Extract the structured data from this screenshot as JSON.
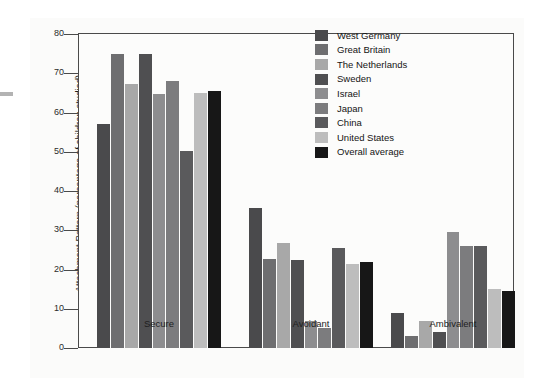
{
  "chart_data": {
    "type": "bar",
    "title": "",
    "xlabel": "",
    "ylabel": "Attachment Pattern (percentage of children studied)",
    "categories": [
      "Secure",
      "Avoidant",
      "Ambivalent"
    ],
    "ylim": [
      0,
      80
    ],
    "yticks": [
      0,
      10,
      20,
      30,
      40,
      50,
      60,
      70,
      80
    ],
    "grid": false,
    "legend_position": "top-right",
    "series": [
      {
        "name": "West Germany",
        "color": "#4a4a4c",
        "values": [
          57.0,
          35.8,
          8.8
        ]
      },
      {
        "name": "Great Britain",
        "color": "#6e6e70",
        "values": [
          75.0,
          22.8,
          3.0
        ]
      },
      {
        "name": "The Netherlands",
        "color": "#a8a8a8",
        "values": [
          67.3,
          26.8,
          7.0
        ]
      },
      {
        "name": "Sweden",
        "color": "#4f4f51",
        "values": [
          74.8,
          22.4,
          4.2
        ]
      },
      {
        "name": "Israel",
        "color": "#8d8d8f",
        "values": [
          64.8,
          6.8,
          29.5
        ]
      },
      {
        "name": "Japan",
        "color": "#7c7c7e",
        "values": [
          68.0,
          5.2,
          26.0
        ]
      },
      {
        "name": "China",
        "color": "#5a5a5c",
        "values": [
          50.2,
          25.4,
          26.0
        ]
      },
      {
        "name": "United States",
        "color": "#bdbdbd",
        "values": [
          65.0,
          21.4,
          15.0
        ]
      },
      {
        "name": "Overall average",
        "color": "#171717",
        "values": [
          65.4,
          21.8,
          14.4
        ]
      }
    ]
  },
  "axis": {
    "tick_labels": [
      "80",
      "70",
      "60",
      "50",
      "40",
      "30",
      "20",
      "10",
      "0"
    ]
  }
}
